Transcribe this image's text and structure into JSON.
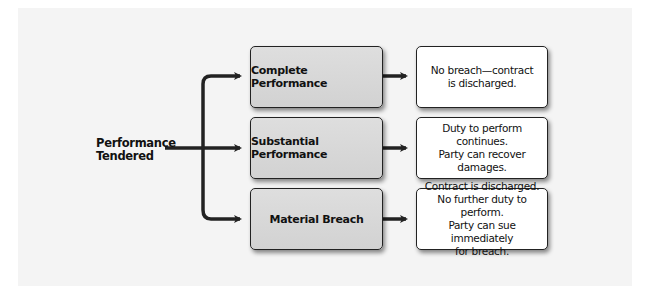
{
  "diagram": {
    "source": {
      "label": "Performance\nTendered"
    },
    "branches": [
      {
        "label": "Complete Performance",
        "outcome": "No breach—contract\nis discharged."
      },
      {
        "label": "Substantial Performance",
        "outcome": "Duty to perform continues.\nParty can recover damages."
      },
      {
        "label": "Material Breach",
        "outcome": "Contract is discharged.\nNo further duty to perform.\nParty can sue immediately\nfor breach."
      }
    ],
    "colors": {
      "arrow": "#222222",
      "mid_box_fill": "#d8d8d8",
      "outcome_box_fill": "#ffffff",
      "panel_bg": "#f4f4f4"
    }
  }
}
